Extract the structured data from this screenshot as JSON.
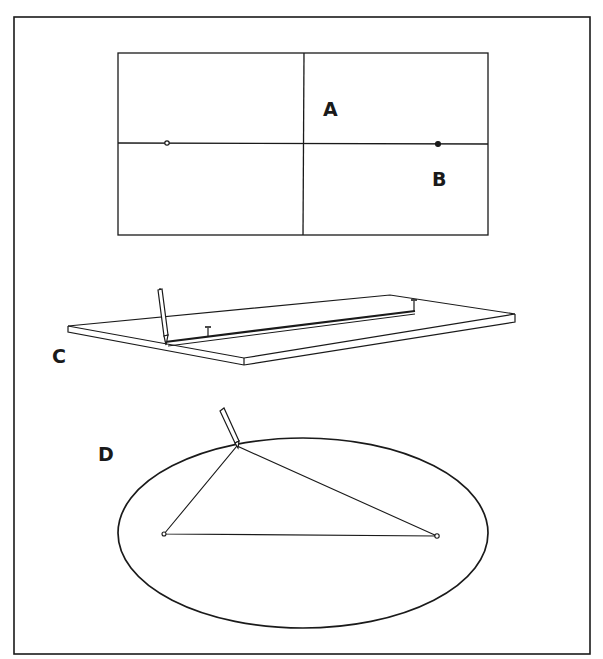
{
  "figure": {
    "colors": {
      "ink": "#1a1a1a",
      "paper": "#ffffff"
    },
    "panels": [
      {
        "id": "A",
        "label": "A",
        "content": "rectangle divided by centre lines into four quadrants"
      },
      {
        "id": "B",
        "label": "B",
        "content": "focus points marked on the major axis"
      },
      {
        "id": "C",
        "label": "C",
        "content": "board with pins at the foci and pencil drawing along a string"
      },
      {
        "id": "D",
        "label": "D",
        "content": "completed ellipse with string triangle from both foci to pencil"
      }
    ]
  }
}
